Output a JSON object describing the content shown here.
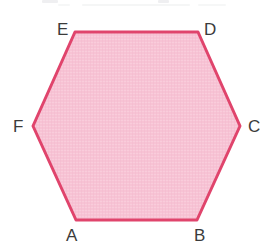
{
  "figure": {
    "shape_name": "hexagon",
    "sides": 6,
    "background_color": "#ffffff",
    "fill_color": "#f7c3d4",
    "fill_texture": "woven-hatch",
    "stroke_color": "#e0446c",
    "stroke_width": 3,
    "label_color": "#3b3b3b",
    "vertices": [
      {
        "label": "A",
        "x": 76,
        "y": 220
      },
      {
        "label": "B",
        "x": 197,
        "y": 220
      },
      {
        "label": "C",
        "x": 240,
        "y": 126
      },
      {
        "label": "D",
        "x": 198,
        "y": 32
      },
      {
        "label": "E",
        "x": 75,
        "y": 32
      },
      {
        "label": "F",
        "x": 33,
        "y": 126
      }
    ],
    "polygon_points": "76,220 197,220 240,126 198,32 75,32 33,126"
  }
}
